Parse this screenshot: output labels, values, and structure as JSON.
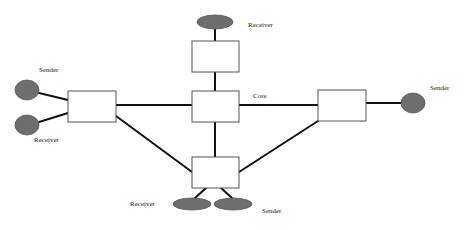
{
  "diagram": {
    "type": "network-topology",
    "colors": {
      "background": "#ffffff",
      "node_fill": "#ffffff",
      "node_stroke": "#555555",
      "host_fill": "#6e6e6e",
      "host_stroke": "#555555",
      "link": "#111111"
    },
    "routers": [
      {
        "id": "top",
        "x": 192,
        "y": 41,
        "w": 47,
        "h": 31
      },
      {
        "id": "core",
        "x": 192,
        "y": 91,
        "w": 47,
        "h": 31
      },
      {
        "id": "left",
        "x": 68,
        "y": 91,
        "w": 48,
        "h": 31
      },
      {
        "id": "right",
        "x": 318,
        "y": 90,
        "w": 48,
        "h": 31
      },
      {
        "id": "bottom",
        "x": 192,
        "y": 157,
        "w": 47,
        "h": 31
      }
    ],
    "hosts": [
      {
        "id": "top-receiver",
        "role": "Receiver",
        "shape": "ellipse",
        "cx": 215,
        "cy": 22,
        "rx": 18,
        "ry": 7
      },
      {
        "id": "left-sender",
        "role": "Sender",
        "shape": "ellipse",
        "cx": 27,
        "cy": 90,
        "rx": 12,
        "ry": 10
      },
      {
        "id": "left-receiver",
        "role": "Receiver",
        "shape": "ellipse",
        "cx": 27,
        "cy": 125,
        "rx": 12,
        "ry": 10
      },
      {
        "id": "right-sender",
        "role": "Sender",
        "shape": "ellipse",
        "cx": 413,
        "cy": 103,
        "rx": 12,
        "ry": 10
      },
      {
        "id": "bottom-receiver",
        "role": "Receiver",
        "shape": "ellipse",
        "cx": 192,
        "cy": 204,
        "rx": 19,
        "ry": 6
      },
      {
        "id": "bottom-sender",
        "role": "Sender",
        "shape": "ellipse",
        "cx": 233,
        "cy": 204,
        "rx": 19,
        "ry": 6
      }
    ],
    "links": [
      {
        "from": "top-receiver",
        "to": "top",
        "x1": 215,
        "y1": 29,
        "x2": 215,
        "y2": 41
      },
      {
        "from": "top",
        "to": "core",
        "x1": 215,
        "y1": 72,
        "x2": 215,
        "y2": 91
      },
      {
        "from": "core",
        "to": "bottom",
        "x1": 215,
        "y1": 122,
        "x2": 215,
        "y2": 157
      },
      {
        "from": "left",
        "to": "core",
        "x1": 116,
        "y1": 105,
        "x2": 192,
        "y2": 105
      },
      {
        "from": "core",
        "to": "right",
        "x1": 239,
        "y1": 105,
        "x2": 318,
        "y2": 105
      },
      {
        "from": "right",
        "to": "right-sender",
        "x1": 366,
        "y1": 103,
        "x2": 401,
        "y2": 103
      },
      {
        "from": "left-sender",
        "to": "left",
        "x1": 39,
        "y1": 93,
        "x2": 68,
        "y2": 100
      },
      {
        "from": "left-receiver",
        "to": "left",
        "x1": 39,
        "y1": 122,
        "x2": 68,
        "y2": 113
      },
      {
        "from": "left",
        "to": "bottom",
        "x1": 116,
        "y1": 116,
        "x2": 192,
        "y2": 172
      },
      {
        "from": "right",
        "to": "bottom",
        "x1": 318,
        "y1": 121,
        "x2": 239,
        "y2": 172
      },
      {
        "from": "bottom",
        "to": "bottom-receiver",
        "x1": 206,
        "y1": 188,
        "x2": 195,
        "y2": 198
      },
      {
        "from": "bottom",
        "to": "bottom-sender",
        "x1": 221,
        "y1": 188,
        "x2": 232,
        "y2": 198
      }
    ]
  },
  "labels": {
    "top_receiver": "Receiver",
    "left_sender": "Sender",
    "left_receiver": "Receiver",
    "core": "Core",
    "right_sender": "Sender",
    "bottom_receiver": "Receiver",
    "bottom_sender": "Sender"
  }
}
